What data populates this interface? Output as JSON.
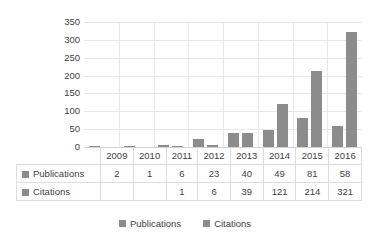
{
  "chart_data": {
    "type": "bar",
    "title": "",
    "xlabel": "",
    "ylabel": "Publications and citations",
    "categories": [
      "2009",
      "2010",
      "2011",
      "2012",
      "2013",
      "2014",
      "2015",
      "2016"
    ],
    "series": [
      {
        "name": "Publications",
        "values": [
          2,
          1,
          6,
          23,
          40,
          49,
          81,
          58
        ],
        "color": "#8c8c8c"
      },
      {
        "name": "Citations",
        "values": [
          null,
          null,
          1,
          6,
          39,
          121,
          214,
          321
        ],
        "color": "#8c8c8c"
      }
    ],
    "ylim": [
      0,
      350
    ],
    "y_ticks": [
      0,
      50,
      100,
      150,
      200,
      250,
      300,
      350
    ],
    "grid": true,
    "legend_position": "bottom"
  },
  "axis": {
    "y_title": "Publications and citations",
    "tick_labels": [
      "350",
      "300",
      "250",
      "200",
      "150",
      "100",
      "50",
      "0"
    ]
  },
  "table": {
    "header": [
      "",
      "2009",
      "2010",
      "2011",
      "2012",
      "2013",
      "2014",
      "2015",
      "2016"
    ],
    "rows": [
      {
        "label": "Publications",
        "cells": [
          "2",
          "1",
          "6",
          "23",
          "40",
          "49",
          "81",
          "58"
        ]
      },
      {
        "label": "Citations",
        "cells": [
          "",
          "",
          "1",
          "6",
          "39",
          "121",
          "214",
          "321"
        ]
      }
    ]
  },
  "legend": {
    "items": [
      {
        "label": "Publications",
        "color": "#8c8c8c"
      },
      {
        "label": "Citations",
        "color": "#8c8c8c"
      }
    ]
  }
}
